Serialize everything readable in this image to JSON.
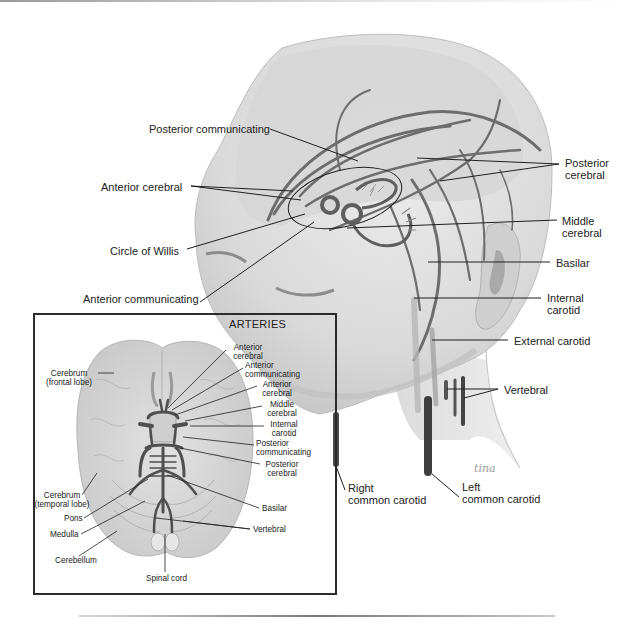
{
  "figure": {
    "signature": "tina",
    "colors": {
      "artery": "#6d6d6d",
      "artery_dark": "#3e3e3e",
      "skin": "#dcdcdc",
      "skin_shadow": "#c4c4c4",
      "brain": "#d2d2d2",
      "leader": "#1f1f1f",
      "label": "#222222",
      "background": "#ffffff"
    }
  },
  "main_labels": [
    {
      "id": "posterior-communicating",
      "lines": [
        "Posterior communicating"
      ],
      "x": 120,
      "y": 123,
      "align": "right",
      "w": 150,
      "leaders": [
        [
          270,
          129,
          358,
          161
        ]
      ]
    },
    {
      "id": "anterior-cerebral",
      "lines": [
        "Anterior cerebral"
      ],
      "x": 101,
      "y": 181,
      "align": "left",
      "w": 100,
      "leaders": [
        [
          191,
          186,
          293,
          191
        ],
        [
          191,
          186,
          301,
          200
        ]
      ]
    },
    {
      "id": "circle-of-willis",
      "lines": [
        "Circle of Willis"
      ],
      "x": 110,
      "y": 245,
      "align": "left",
      "w": 85,
      "leaders": [
        [
          187,
          249,
          305,
          214
        ]
      ]
    },
    {
      "id": "anterior-communicating",
      "lines": [
        "Anterior communicating"
      ],
      "x": 83,
      "y": 293,
      "align": "left",
      "w": 140,
      "leaders": [
        [
          200,
          302,
          314,
          222
        ]
      ]
    },
    {
      "id": "posterior-cerebral",
      "lines": [
        "Posterior",
        "cerebral"
      ],
      "x": 565,
      "y": 157,
      "align": "left",
      "w": 60,
      "leaders": [
        [
          559,
          164,
          417,
          158
        ],
        [
          559,
          164,
          440,
          181
        ]
      ]
    },
    {
      "id": "middle-cerebral",
      "lines": [
        "Middle",
        "cerebral"
      ],
      "x": 562,
      "y": 215,
      "align": "left",
      "w": 60,
      "leaders": [
        [
          557,
          220,
          347,
          228
        ]
      ]
    },
    {
      "id": "basilar",
      "lines": [
        "Basilar"
      ],
      "x": 556,
      "y": 257,
      "align": "left",
      "w": 60,
      "leaders": [
        [
          550,
          262,
          428,
          262
        ]
      ]
    },
    {
      "id": "internal-carotid",
      "lines": [
        "Internal",
        "carotid"
      ],
      "x": 547,
      "y": 292,
      "align": "left",
      "w": 60,
      "leaders": [
        [
          541,
          298,
          414,
          298
        ]
      ]
    },
    {
      "id": "external-carotid",
      "lines": [
        "External carotid"
      ],
      "x": 514,
      "y": 335,
      "align": "left",
      "w": 110,
      "leaders": [
        [
          508,
          340,
          432,
          340
        ]
      ]
    },
    {
      "id": "vertebral",
      "lines": [
        "Vertebral"
      ],
      "x": 504,
      "y": 384,
      "align": "left",
      "w": 70,
      "leaders": [
        [
          498,
          389,
          447,
          389
        ],
        [
          498,
          389,
          464,
          398
        ]
      ]
    },
    {
      "id": "right-common-carotid",
      "lines": [
        "Right",
        "common carotid"
      ],
      "x": 348,
      "y": 482,
      "align": "left",
      "w": 100,
      "leaders": [
        [
          345,
          490,
          336,
          466
        ]
      ]
    },
    {
      "id": "left-common-carotid",
      "lines": [
        "Left",
        "common carotid"
      ],
      "x": 462,
      "y": 481,
      "align": "left",
      "w": 100,
      "leaders": [
        [
          459,
          497,
          432,
          474
        ]
      ]
    }
  ],
  "inset": {
    "title": "ARTERIES",
    "labels": [
      {
        "id": "inset-anterior-cerebral-1",
        "lines": [
          "Anterior",
          "cerebral"
        ],
        "x": 224,
        "y": 344,
        "align": "center",
        "w": 48,
        "leaders": [
          [
            226,
            350,
            168,
            408
          ]
        ]
      },
      {
        "id": "inset-anterior-communicating",
        "lines": [
          "Anterior",
          "communicating"
        ],
        "x": 245,
        "y": 362,
        "align": "left",
        "w": 64,
        "leaders": [
          [
            243,
            368,
            172,
            410
          ]
        ]
      },
      {
        "id": "inset-anterior-cerebral-2",
        "lines": [
          "Anterior",
          "cerebral"
        ],
        "x": 257,
        "y": 381,
        "align": "center",
        "w": 40,
        "leaders": [
          [
            257,
            386,
            175,
            415
          ]
        ]
      },
      {
        "id": "inset-middle-cerebral",
        "lines": [
          "Middle",
          "cerebral"
        ],
        "x": 262,
        "y": 401,
        "align": "center",
        "w": 40,
        "leaders": [
          [
            262,
            406,
            185,
            421
          ]
        ]
      },
      {
        "id": "inset-internal-carotid",
        "lines": [
          "Internal",
          "carotid"
        ],
        "x": 266,
        "y": 421,
        "align": "center",
        "w": 36,
        "leaders": [
          [
            264,
            426,
            190,
            426
          ]
        ]
      },
      {
        "id": "inset-posterior-communicating",
        "lines": [
          "Posterior",
          "communicating"
        ],
        "x": 256,
        "y": 440,
        "align": "left",
        "w": 64,
        "leaders": [
          [
            254,
            445,
            183,
            437
          ]
        ]
      },
      {
        "id": "inset-posterior-cerebral",
        "lines": [
          "Posterior",
          "cerebral"
        ],
        "x": 260,
        "y": 461,
        "align": "center",
        "w": 44,
        "leaders": [
          [
            260,
            464,
            180,
            448
          ]
        ]
      },
      {
        "id": "inset-basilar",
        "lines": [
          "Basilar"
        ],
        "x": 262,
        "y": 505,
        "align": "left",
        "w": 40,
        "leaders": [
          [
            259,
            508,
            167,
            475
          ]
        ]
      },
      {
        "id": "inset-vertebral",
        "lines": [
          "Vertebral"
        ],
        "x": 253,
        "y": 526,
        "align": "left",
        "w": 44,
        "leaders": [
          [
            250,
            529,
            156,
            518
          ],
          [
            250,
            529,
            183,
            521
          ]
        ]
      },
      {
        "id": "inset-cerebrum-frontal",
        "lines": [
          "Cerebrum",
          "(frontal lobe)"
        ],
        "x": 40,
        "y": 370,
        "align": "center",
        "w": 58,
        "leaders": [
          [
            98,
            373,
            114,
            373
          ]
        ]
      },
      {
        "id": "inset-cerebrum-temporal",
        "lines": [
          "Cerebrum",
          "(temporal lobe)"
        ],
        "x": 33,
        "y": 492,
        "align": "center",
        "w": 58,
        "leaders": [
          [
            82,
            495,
            97,
            473
          ]
        ]
      },
      {
        "id": "inset-pons",
        "lines": [
          "Pons"
        ],
        "x": 64,
        "y": 515,
        "align": "left",
        "w": 24,
        "leaders": [
          [
            84,
            518,
            148,
            479
          ]
        ]
      },
      {
        "id": "inset-medulla",
        "lines": [
          "Medulla"
        ],
        "x": 50,
        "y": 531,
        "align": "left",
        "w": 34,
        "leaders": [
          [
            81,
            534,
            145,
            501
          ]
        ]
      },
      {
        "id": "inset-cerebellum",
        "lines": [
          "Cerebellum"
        ],
        "x": 55,
        "y": 557,
        "align": "left",
        "w": 48,
        "leaders": [
          [
            79,
            556,
            117,
            531
          ]
        ]
      },
      {
        "id": "inset-spinal-cord",
        "lines": [
          "Spinal cord"
        ],
        "x": 146,
        "y": 575,
        "align": "left",
        "w": 52,
        "leaders": [
          [
            165,
            572,
            165,
            534
          ]
        ]
      }
    ]
  }
}
